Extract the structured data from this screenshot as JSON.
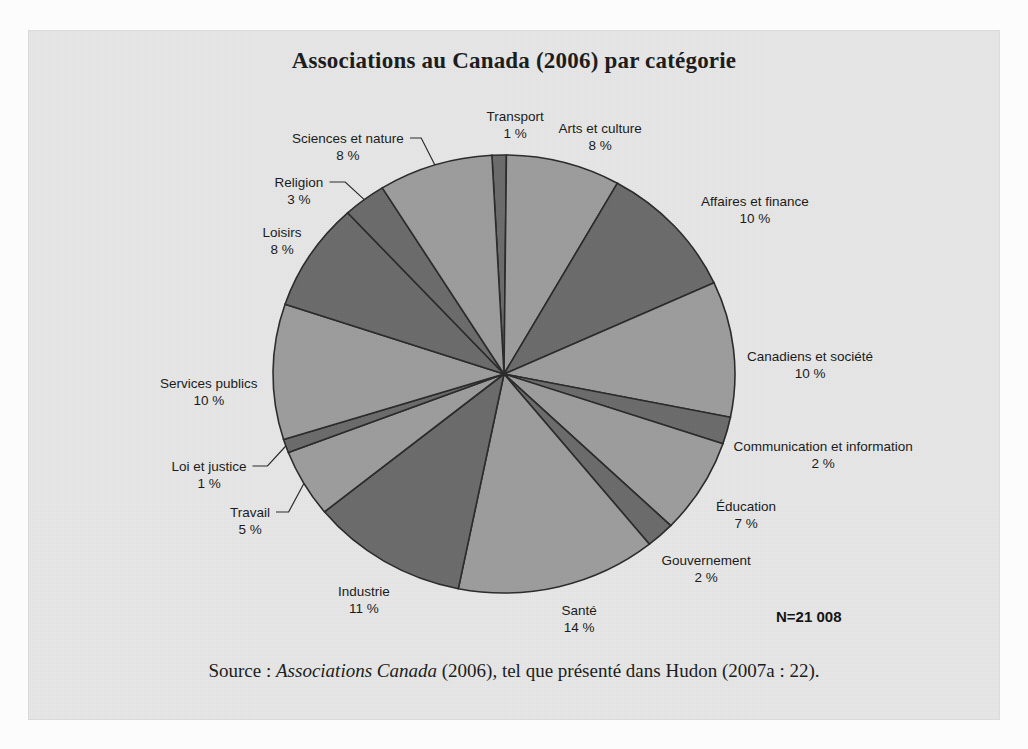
{
  "figure": {
    "title": "Associations au Canada (2006) par catégorie",
    "total_label": "N=21 008",
    "source_prefix": "Source : ",
    "source_italic": "Associations Canada",
    "source_suffix": " (2006), tel que présenté dans Hudon (2007a : 22).",
    "percent_symbol": "%",
    "background_color": "#e6e7e6",
    "slice_light_color": "#9d9d9d",
    "slice_dark_color": "#6b6b6b",
    "slice_outline_color": "#2b2b2b",
    "text_color": "#1a1a1a"
  },
  "chart_data": {
    "type": "pie",
    "title": "Associations au Canada (2006) par catégorie",
    "xlabel": "",
    "ylabel": "",
    "legend_position": "none",
    "grid": false,
    "units": "percent",
    "total": "21 008",
    "start_angle_deg": -3,
    "direction": "clockwise",
    "categories": [
      "Transport",
      "Arts et culture",
      "Affaires et finance",
      "Canadiens et société",
      "Communication et information",
      "Éducation",
      "Gouvernement",
      "Santé",
      "Industrie",
      "Travail",
      "Loi et justice",
      "Services publics",
      "Loisirs",
      "Religion",
      "Sciences et nature"
    ],
    "values": [
      1,
      8,
      10,
      10,
      2,
      7,
      2,
      14,
      11,
      5,
      1,
      10,
      8,
      3,
      8
    ],
    "slices": [
      {
        "label": "Transport",
        "value": 1,
        "pct_text": "1 %",
        "shade": "dark",
        "label_x": 487,
        "label_y": 78,
        "leader": false
      },
      {
        "label": "Arts et culture",
        "value": 8,
        "pct_text": "8 %",
        "shade": "light",
        "label_x": 572,
        "label_y": 90,
        "leader": false
      },
      {
        "label": "Affaires et finance",
        "value": 10,
        "pct_text": "10 %",
        "shade": "dark",
        "label_x": 727,
        "label_y": 163,
        "leader": false
      },
      {
        "label": "Canadiens et société",
        "value": 10,
        "pct_text": "10 %",
        "shade": "light",
        "label_x": 782,
        "label_y": 318,
        "leader": false
      },
      {
        "label": "Communication et information",
        "value": 2,
        "pct_text": "2 %",
        "shade": "dark",
        "label_x": 795,
        "label_y": 408,
        "leader": false
      },
      {
        "label": "Éducation",
        "value": 7,
        "pct_text": "7 %",
        "shade": "light",
        "label_x": 718,
        "label_y": 468,
        "leader": false
      },
      {
        "label": "Gouvernement",
        "value": 2,
        "pct_text": "2 %",
        "shade": "dark",
        "label_x": 678,
        "label_y": 522,
        "leader": false
      },
      {
        "label": "Santé",
        "value": 14,
        "pct_text": "14 %",
        "shade": "light",
        "label_x": 551,
        "label_y": 572,
        "leader": false
      },
      {
        "label": "Industrie",
        "value": 11,
        "pct_text": "11 %",
        "shade": "dark",
        "label_x": 336,
        "label_y": 553,
        "leader": false
      },
      {
        "label": "Travail",
        "value": 5,
        "pct_text": "5 %",
        "shade": "light",
        "label_x": 222,
        "label_y": 474,
        "leader": true
      },
      {
        "label": "Loi et justice",
        "value": 1,
        "pct_text": "1 %",
        "shade": "dark",
        "label_x": 181,
        "label_y": 428,
        "leader": true
      },
      {
        "label": "Services publics",
        "value": 10,
        "pct_text": "10 %",
        "shade": "light",
        "label_x": 181,
        "label_y": 345,
        "leader": false
      },
      {
        "label": "Loisirs",
        "value": 8,
        "pct_text": "8 %",
        "shade": "dark",
        "label_x": 254,
        "label_y": 194,
        "leader": false
      },
      {
        "label": "Religion",
        "value": 3,
        "pct_text": "3 %",
        "shade": "dark",
        "label_x": 271,
        "label_y": 144,
        "leader": true
      },
      {
        "label": "Sciences et nature",
        "value": 8,
        "pct_text": "8 %",
        "shade": "light",
        "label_x": 320,
        "label_y": 100,
        "leader": true
      }
    ]
  }
}
